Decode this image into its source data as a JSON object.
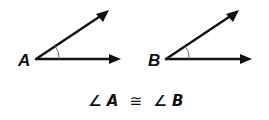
{
  "diagram": {
    "angles": [
      {
        "vertex_label": "A"
      },
      {
        "vertex_label": "B"
      }
    ],
    "caption": {
      "angle_symbol": "∠",
      "left": "A",
      "relation": "≅",
      "right": "B"
    }
  }
}
